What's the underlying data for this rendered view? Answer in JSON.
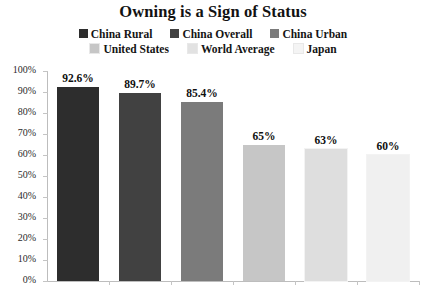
{
  "chart_data": {
    "type": "bar",
    "title": "Owning is a Sign of Status",
    "xlabel": "",
    "ylabel": "",
    "ylim": [
      0,
      100
    ],
    "grid": false,
    "legend_position": "top-center",
    "categories": [
      "China Rural",
      "China Overall",
      "China Urban",
      "United States",
      "World Average",
      "Japan"
    ],
    "values": [
      92.6,
      89.7,
      85.4,
      65,
      63,
      60
    ],
    "value_labels": [
      "92.6%",
      "89.7%",
      "85.4%",
      "65%",
      "63%",
      "60%"
    ],
    "colors": [
      "#2d2d2d",
      "#414141",
      "#7b7b7b",
      "#c6c6c6",
      "#dedede",
      "#f0f0f0"
    ],
    "ytick_labels": [
      "100%",
      "90%",
      "80%",
      "70%",
      "60%",
      "50%",
      "40%",
      "30%",
      "20%",
      "10%",
      "0%"
    ],
    "ytick_values": [
      100,
      90,
      80,
      70,
      60,
      50,
      40,
      30,
      20,
      10,
      0
    ]
  },
  "legend": {
    "rows": [
      [
        {
          "label": "China Rural",
          "color": "#2d2d2d"
        },
        {
          "label": "China Overall",
          "color": "#414141"
        },
        {
          "label": "China Urban",
          "color": "#7b7b7b"
        }
      ],
      [
        {
          "label": "United States",
          "color": "#c6c6c6"
        },
        {
          "label": "World Average",
          "color": "#e2e2e2"
        },
        {
          "label": "Japan",
          "color": "#f4f4f4"
        }
      ]
    ]
  },
  "footer": {
    "source_note": ""
  }
}
